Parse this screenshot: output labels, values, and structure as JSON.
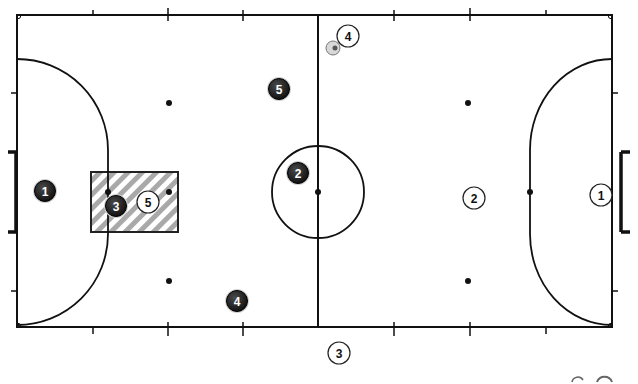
{
  "diagram": {
    "type": "futsal-court-formation",
    "colors": {
      "line": "#111111",
      "hatch": "#a9a9a9",
      "dark_player_fill": "#1a1a1a",
      "light_player_fill": "#ffffff"
    },
    "dark_team": [
      {
        "number": "1",
        "x": 45,
        "y": 191
      },
      {
        "number": "2",
        "x": 298,
        "y": 173
      },
      {
        "number": "3",
        "x": 116,
        "y": 206
      },
      {
        "number": "4",
        "x": 237,
        "y": 301
      },
      {
        "number": "5",
        "x": 279,
        "y": 89
      }
    ],
    "light_team": [
      {
        "number": "1",
        "x": 601,
        "y": 195
      },
      {
        "number": "2",
        "x": 474,
        "y": 198
      },
      {
        "number": "3",
        "x": 339,
        "y": 353
      },
      {
        "number": "4",
        "x": 348,
        "y": 36
      },
      {
        "number": "5",
        "x": 148,
        "y": 202
      }
    ],
    "ball": {
      "x": 333,
      "y": 48
    },
    "zone": {
      "label": "hatched-zone",
      "x": 91,
      "y": 172,
      "width": 87,
      "height": 60
    }
  }
}
